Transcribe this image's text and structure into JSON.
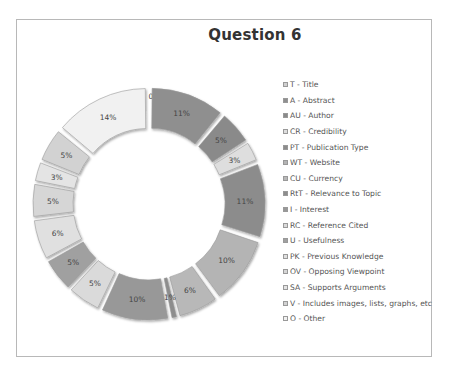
{
  "chart": {
    "title": "Question 6"
  },
  "legend": {
    "position": "right",
    "items": [
      {
        "label": "T - Title",
        "color": "#cfcfcf"
      },
      {
        "label": "A - Abstract",
        "color": "#9a9a9a"
      },
      {
        "label": "AU - Author",
        "color": "#b5b5b5"
      },
      {
        "label": "CR - Credibility",
        "color": "#8e8e8e"
      },
      {
        "label": "PT - Publication Type",
        "color": "#bdbdbd"
      },
      {
        "label": "WT - Website",
        "color": "#c4c4c4"
      },
      {
        "label": "CU - Currency",
        "color": "#aeaeae"
      },
      {
        "label": "RtT - Relevance to Topic",
        "color": "#a3a3a3"
      },
      {
        "label": "I - Interest",
        "color": "#dcdcdc"
      },
      {
        "label": "RC - Reference Cited",
        "color": "#8f8f8f"
      },
      {
        "label": "U - Usefulness",
        "color": "#c8c8c8"
      },
      {
        "label": "PK - Previous Knowledge",
        "color": "#9d9d9d"
      },
      {
        "label": "OV - Opposing Viewpoint",
        "color": "#d3d3d3"
      },
      {
        "label": "SA - Supports Arguments",
        "color": "#b0b0b0"
      },
      {
        "label": "V - Includes images, lists, graphs, etc",
        "color": "#d8d8d8"
      },
      {
        "label": "O - Other",
        "color": "#e6e6e6"
      }
    ]
  },
  "chart_data": {
    "type": "pie",
    "subtype": "exploded doughnut",
    "title": "Question 6",
    "categories": [
      "T - Title",
      "A - Abstract",
      "AU - Author",
      "CR - Credibility",
      "PT - Publication Type",
      "WT - Website",
      "CU - Currency",
      "RtT - Relevance to Topic",
      "I - Interest",
      "RC - Reference Cited",
      "U - Usefulness",
      "PK - Previous Knowledge",
      "OV - Opposing Viewpoint",
      "SA - Supports Arguments",
      "V - Includes images, lists, graphs, etc",
      "O - Other"
    ],
    "values": [
      0,
      11,
      5,
      3,
      11,
      10,
      6,
      1,
      10,
      5,
      5,
      6,
      5,
      3,
      5,
      14
    ],
    "value_labels": [
      "0%",
      "11%",
      "5%",
      "3%",
      "11%",
      "10%",
      "6%",
      "1%",
      "10%",
      "5%",
      "5%",
      "6%",
      "5%",
      "3%",
      "5%",
      "14%"
    ],
    "unit": "%",
    "start_angle": "12 o'clock",
    "direction": "clockwise",
    "legend_position": "right",
    "segment_colors": [
      "#d0d0d0",
      "#8f8f8f",
      "#8a8a8a",
      "#dedede",
      "#8c8c8c",
      "#b4b4b4",
      "#b8b8b8",
      "#8d8d8d",
      "#989898",
      "#dadada",
      "#a0a0a0",
      "#e0e0e0",
      "#d6d6d6",
      "#e4e4e4",
      "#d2d2d2",
      "#f1f1f1"
    ]
  }
}
